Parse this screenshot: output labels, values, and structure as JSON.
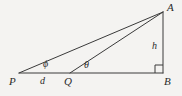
{
  "figure": {
    "background_color": "#f4f3f1",
    "stroke_color": "#3a3a3a",
    "label_color": "#2b2b2b",
    "vertices": {
      "A": {
        "label": "A",
        "x": 163,
        "y": 12,
        "label_x": 167,
        "label_y": 2
      },
      "B": {
        "label": "B",
        "x": 163,
        "y": 73,
        "label_x": 164,
        "label_y": 76
      },
      "P": {
        "label": "P",
        "x": 19,
        "y": 73,
        "label_x": 9,
        "label_y": 76
      },
      "Q": {
        "label": "Q",
        "x": 70,
        "y": 73,
        "label_x": 64,
        "label_y": 76
      }
    },
    "segments": [
      {
        "name": "baseline-PB",
        "from": "P",
        "to": "B"
      },
      {
        "name": "height-AB",
        "from": "A",
        "to": "B"
      },
      {
        "name": "hypotenuse-PA",
        "from": "P",
        "to": "A"
      },
      {
        "name": "hypotenuse-QA",
        "from": "Q",
        "to": "A"
      }
    ],
    "side_labels": [
      {
        "name": "height-label",
        "text": "h",
        "x": 152,
        "y": 41
      },
      {
        "name": "distance-label",
        "text": "d",
        "x": 40,
        "y": 76
      }
    ],
    "angle_labels": [
      {
        "name": "angle-phi-label",
        "text": "ϕ",
        "x": 43,
        "y": 59
      },
      {
        "name": "angle-theta-label",
        "text": "θ",
        "x": 84,
        "y": 60
      }
    ],
    "right_angle": {
      "name": "right-angle-marker",
      "at": "B",
      "size": 8
    }
  }
}
